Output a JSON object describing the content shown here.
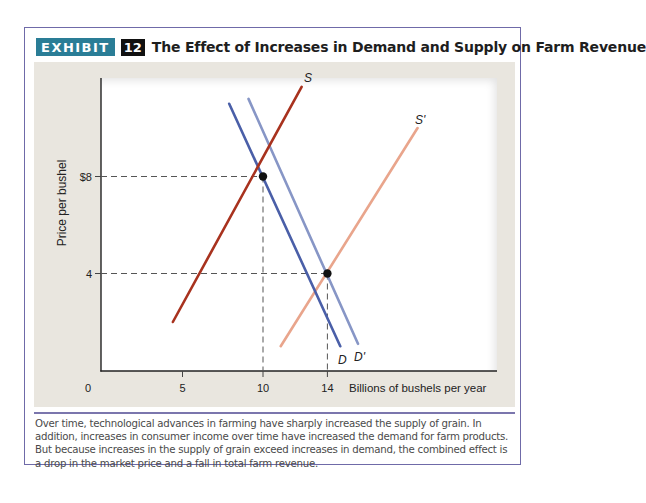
{
  "header": {
    "exhibit_label": "EXHIBIT",
    "exhibit_number": "12",
    "title": "The Effect of Increases in Demand and Supply on Farm Revenue",
    "exhibit_color": "#2a7d96"
  },
  "axes": {
    "ylabel": "Price per bushel",
    "xlabel": "Billions of bushels per year",
    "y_ticks": [
      {
        "value": 8,
        "label": "$8"
      },
      {
        "value": 4,
        "label": "4"
      }
    ],
    "x_ticks": [
      {
        "value": 0,
        "label": "0"
      },
      {
        "value": 5,
        "label": "5"
      },
      {
        "value": 10,
        "label": "10"
      },
      {
        "value": 14,
        "label": "14"
      }
    ]
  },
  "caption": "Over time, technological advances in farming have sharply increased the supply of grain. In addition, increases in consumer income over time have increased the demand for farm products. But because increases in the supply of grain exceed increases in demand, the combined effect is a drop in the market price and a fall in total farm revenue.",
  "chart_data": {
    "type": "line",
    "title": "The Effect of Increases in Demand and Supply on Farm Revenue",
    "xlabel": "Billions of bushels per year",
    "ylabel": "Price per bushel",
    "xlim": [
      0,
      24.5
    ],
    "ylim": [
      0,
      12
    ],
    "grid": false,
    "legend": "inline labels at line ends",
    "x_ticks": [
      0,
      5,
      10,
      14
    ],
    "y_ticks": [
      4,
      8
    ],
    "y_tick_labels": [
      "4",
      "$8"
    ],
    "series": [
      {
        "name": "S",
        "kind": "supply",
        "color": "#a8321e",
        "points": [
          [
            4.4,
            2.0
          ],
          [
            12.4,
            11.7
          ]
        ]
      },
      {
        "name": "S'",
        "kind": "supply",
        "color": "#e9a58c",
        "points": [
          [
            11.1,
            1.0
          ],
          [
            19.6,
            10.0
          ]
        ]
      },
      {
        "name": "D",
        "kind": "demand",
        "color": "#4a5fa8",
        "points": [
          [
            7.9,
            11.0
          ],
          [
            14.8,
            1.0
          ]
        ]
      },
      {
        "name": "D'",
        "kind": "demand",
        "color": "#8796c6",
        "points": [
          [
            9.1,
            11.2
          ],
          [
            15.9,
            1.1
          ]
        ]
      }
    ],
    "equilibria": [
      {
        "label": "S-D",
        "quantity": 10,
        "price": 8
      },
      {
        "label": "S'-D'",
        "quantity": 14,
        "price": 4
      }
    ],
    "annotations": [
      "dashed guide lines from equilibria to both axes"
    ]
  }
}
